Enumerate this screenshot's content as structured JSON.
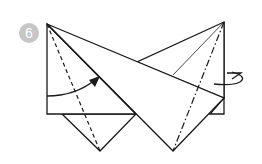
{
  "diagram": {
    "type": "origami-fold-step",
    "step_number": "6",
    "badge_color": "#c6c6c6",
    "line_color": "#1a1a1a",
    "paper_color": "#ffffff",
    "annotations": [
      {
        "name": "valley-fold-arrow",
        "description": "curved arrow folding left edge toward center"
      },
      {
        "name": "turn-over-arrow",
        "description": "looped arrow on right side indicating fold behind"
      }
    ],
    "fold_lines": [
      {
        "style": "dashed",
        "role": "valley-fold"
      },
      {
        "style": "dash-dot",
        "role": "mountain-fold"
      }
    ]
  }
}
